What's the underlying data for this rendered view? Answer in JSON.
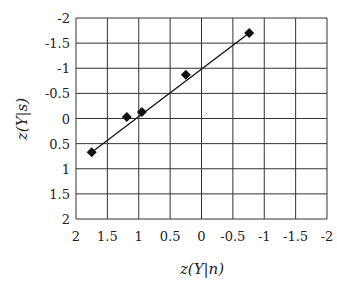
{
  "chart_data": {
    "type": "scatter",
    "title": "",
    "xlabel": "z(Y|n)",
    "ylabel": "z(Y|s)",
    "xlim": [
      2,
      -2
    ],
    "ylim": [
      2,
      -2
    ],
    "x_reversed": true,
    "y_reversed": true,
    "x_ticks": [
      "2",
      "1.5",
      "1",
      "0.5",
      "0",
      "-0.5",
      "-1",
      "-1.5",
      "-2"
    ],
    "y_ticks": [
      "-2",
      "-1.5",
      "-1",
      "-0.5",
      "0",
      "0.5",
      "1",
      "1.5",
      "2"
    ],
    "grid": true,
    "legend": null,
    "series": [
      {
        "name": "observed",
        "marker": "diamond",
        "color": "#111111",
        "x": [
          1.75,
          1.19,
          0.95,
          0.25,
          -0.76
        ],
        "y": [
          0.67,
          -0.03,
          -0.13,
          -0.87,
          -1.7
        ]
      }
    ],
    "fit_line": {
      "color": "#111111",
      "x": [
        1.75,
        -0.76
      ],
      "y": [
        0.67,
        -1.7
      ]
    }
  }
}
